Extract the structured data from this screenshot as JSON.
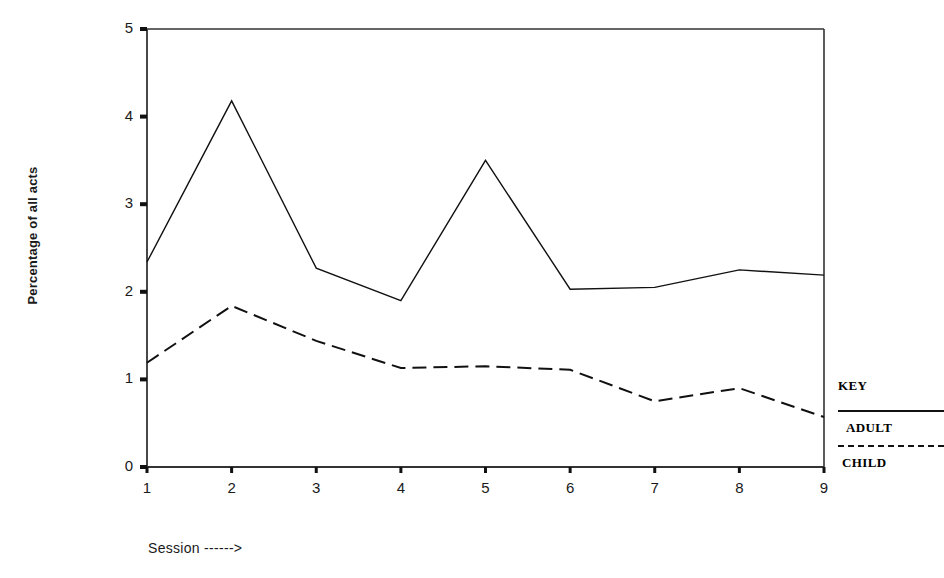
{
  "chart_data": {
    "type": "line",
    "title": "",
    "xlabel": "Session ------>",
    "ylabel": "Percentage of all acts",
    "x": [
      1,
      2,
      3,
      4,
      5,
      6,
      7,
      8,
      9
    ],
    "xlim": [
      1,
      9
    ],
    "ylim": [
      0,
      5
    ],
    "xticks": [
      "1",
      "2",
      "3",
      "4",
      "5",
      "6",
      "7",
      "8",
      "9"
    ],
    "yticks": [
      "0",
      "1",
      "2",
      "3",
      "4",
      "5"
    ],
    "grid": false,
    "legend_position": "right-outside",
    "series": [
      {
        "name": "ADULT",
        "style": "solid",
        "color": "#111111",
        "values": [
          2.34,
          4.18,
          2.27,
          1.9,
          3.5,
          2.03,
          2.05,
          2.25,
          2.19
        ]
      },
      {
        "name": "CHILD",
        "style": "dashed",
        "color": "#111111",
        "values": [
          1.19,
          1.84,
          1.44,
          1.13,
          1.15,
          1.11,
          0.75,
          0.9,
          0.57
        ]
      }
    ]
  },
  "axes": {
    "y_title": "Percentage of all acts",
    "x_title": "Session ------>"
  },
  "legend": {
    "title": "KEY",
    "entries": [
      {
        "label": "ADULT",
        "style": "solid"
      },
      {
        "label": "CHILD",
        "style": "dashed"
      }
    ]
  },
  "colors": {
    "line": "#111111",
    "axis": "#333333",
    "background": "#ffffff",
    "text": "#1a1a1a"
  }
}
